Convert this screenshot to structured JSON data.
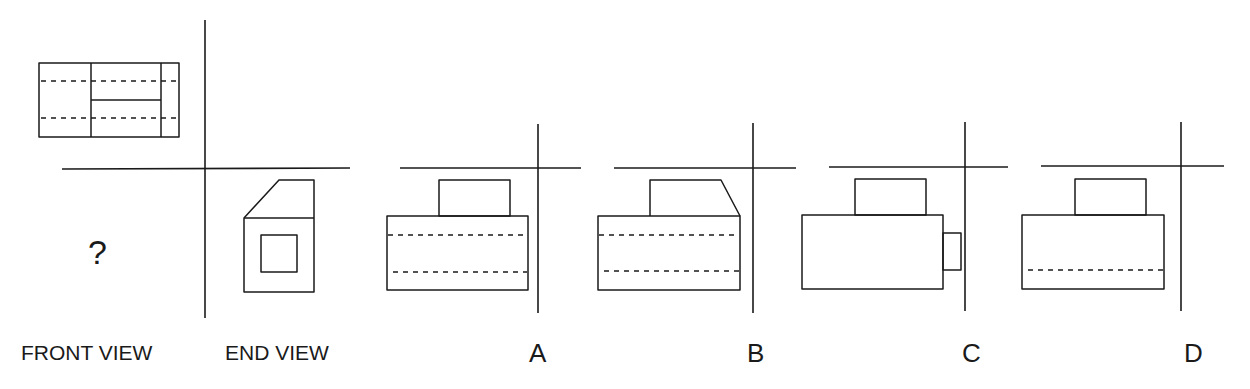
{
  "problem": {
    "question_mark": "?",
    "labels": {
      "front_view": "FRONT VIEW",
      "end_view": "END VIEW"
    }
  },
  "options": [
    {
      "letter": "A",
      "description": "front view with raised block, two hidden lines"
    },
    {
      "letter": "B",
      "description": "front view with chamfered raised block, two hidden lines"
    },
    {
      "letter": "C",
      "description": "front view with raised block and side tab, no hidden lines"
    },
    {
      "letter": "D",
      "description": "front view with raised block, one hidden line"
    }
  ],
  "colors": {
    "line": "#1a1a1a",
    "background": "#ffffff"
  }
}
